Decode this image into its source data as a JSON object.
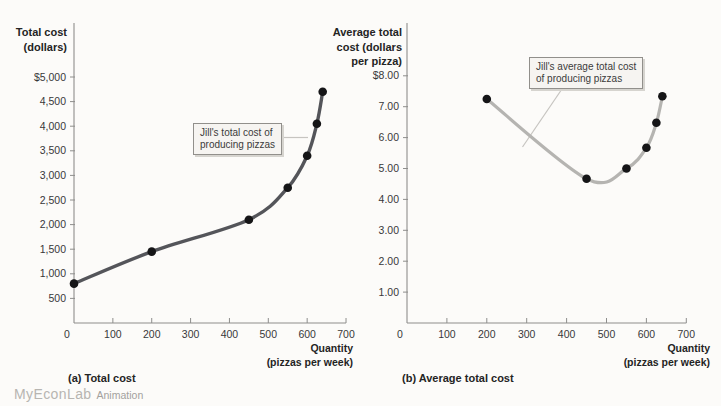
{
  "branding": {
    "logo": "MyEconLab",
    "logo_suffix": "Animation"
  },
  "chart_data": [
    {
      "type": "line",
      "panel": "a",
      "caption": "(a) Total cost",
      "annotation": "Jill's total cost of\nproducing pizzas",
      "y_axis_title_lines": [
        "Total cost",
        "(dollars)"
      ],
      "x_axis_title_lines": [
        "Quantity",
        "(pizzas per week)"
      ],
      "x": [
        0,
        200,
        450,
        550,
        600,
        625,
        640
      ],
      "y": [
        800,
        1450,
        2100,
        2750,
        3400,
        4050,
        4700
      ],
      "x_ticks": [
        0,
        100,
        200,
        300,
        400,
        500,
        600,
        700
      ],
      "x_tick_labels": [
        "0",
        "100",
        "200",
        "300",
        "400",
        "500",
        "600",
        "700"
      ],
      "y_ticks": [
        500,
        1000,
        1500,
        2000,
        2500,
        3000,
        3500,
        4000,
        4500,
        5000
      ],
      "y_tick_labels": [
        "500",
        "1,000",
        "1,500",
        "2,000",
        "2,500",
        "3,000",
        "3,500",
        "4,000",
        "4,500",
        "$5,000"
      ],
      "xlim": [
        0,
        700
      ],
      "ylim": [
        0,
        5000
      ],
      "grid": "off",
      "legend": "none",
      "line_color": "#54555a",
      "marker_color": "#151517"
    },
    {
      "type": "line",
      "panel": "b",
      "caption": "(b) Average total cost",
      "annotation": "Jill's average total cost\nof producing pizzas",
      "y_axis_title_lines": [
        "Average total",
        "cost (dollars",
        "per pizza)"
      ],
      "x_axis_title_lines": [
        "Quantity",
        "(pizzas per week)"
      ],
      "x": [
        200,
        450,
        550,
        600,
        625,
        640
      ],
      "y": [
        7.25,
        4.67,
        5.0,
        5.67,
        6.48,
        7.34
      ],
      "x_ticks": [
        0,
        100,
        200,
        300,
        400,
        500,
        600,
        700
      ],
      "x_tick_labels": [
        "0",
        "100",
        "200",
        "300",
        "400",
        "500",
        "600",
        "700"
      ],
      "y_ticks": [
        1,
        2,
        3,
        4,
        5,
        6,
        7,
        8
      ],
      "y_tick_labels": [
        "1.00",
        "2.00",
        "3.00",
        "4.00",
        "5.00",
        "6.00",
        "7.00",
        "$8.00"
      ],
      "xlim": [
        0,
        700
      ],
      "ylim": [
        0,
        8
      ],
      "grid": "off",
      "legend": "none",
      "line_color": "#b5b4b1",
      "marker_color": "#151517"
    }
  ]
}
